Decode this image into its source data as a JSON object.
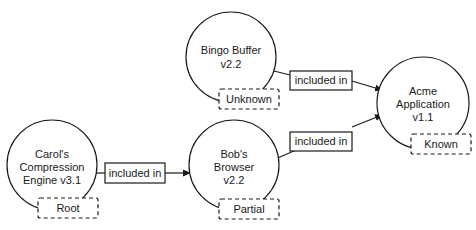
{
  "nodes": [
    {
      "id": "bingo",
      "lines": [
        "Bingo Buffer",
        "v2.2"
      ],
      "status": "Unknown"
    },
    {
      "id": "acme",
      "lines": [
        "Acme",
        "Application",
        "v1.1"
      ],
      "status": "Known"
    },
    {
      "id": "carol",
      "lines": [
        "Carol's",
        "Compression",
        "Engine v3.1"
      ],
      "status": "Root"
    },
    {
      "id": "bob",
      "lines": [
        "Bob's",
        "Browser",
        "v2.2"
      ],
      "status": "Partial"
    }
  ],
  "edges": [
    {
      "from": "carol",
      "to": "bob",
      "label": "included in"
    },
    {
      "from": "bingo",
      "to": "acme",
      "label": "included in"
    },
    {
      "from": "bob",
      "to": "acme",
      "label": "included in"
    }
  ],
  "colors": {
    "stroke": "#1a1a1a",
    "background": "#ffffff"
  }
}
